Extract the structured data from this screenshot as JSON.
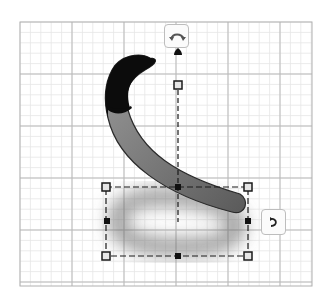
{
  "workplane": {
    "grid": {
      "left": 20,
      "top": 22,
      "right": 312,
      "bottom": 286,
      "minor_step": 10.4,
      "major_step": 52,
      "minor_color": "#e6e6e6",
      "major_color": "#b9b9b9",
      "border_color": "#b0b0b0"
    }
  },
  "shape": {
    "name": "curved-tube",
    "body_color": "#7d7d7d",
    "tip_color": "#0c0c0c",
    "outline_color": "#2a2a2a"
  },
  "shadow": {
    "color": "#6e6e6e"
  },
  "selection_box": {
    "left": 106,
    "top": 187,
    "right": 248,
    "bottom": 256,
    "color": "#1a1a1a"
  },
  "height_handle": {
    "x": 178,
    "top": 85,
    "arrow_y": 52
  },
  "gizmos": {
    "rotate_top": {
      "label": "rotate-around-x",
      "color": "#555555"
    },
    "rotate_side": {
      "label": "rotate-around-z",
      "color": "#222222"
    }
  }
}
